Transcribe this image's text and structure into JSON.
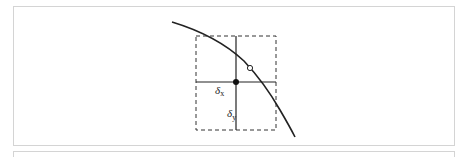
{
  "diagram": {
    "labels": {
      "delta_x": "δ",
      "delta_x_sub": "x",
      "delta_y": "δ",
      "delta_y_sub": "y"
    },
    "elements": {
      "dashed_box": {
        "x": 196,
        "y": 36,
        "w": 80,
        "h": 94
      },
      "crosshair_center": {
        "x": 236,
        "y": 82
      },
      "filled_point": {
        "x": 236,
        "y": 82
      },
      "open_point": {
        "x": 250,
        "y": 68
      },
      "curve": "descending concave curve"
    },
    "colors": {
      "stroke": "#222222",
      "border": "#d4d4d4"
    }
  }
}
